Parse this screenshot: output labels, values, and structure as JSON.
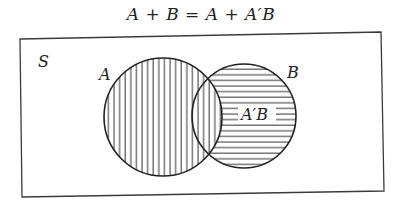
{
  "title": "A + B = A + A′B",
  "diagram": {
    "universe_label": "S",
    "set_a_label": "A",
    "set_b_label": "B",
    "region_label": "A′B",
    "colors": {
      "stroke": "#2a2a2a",
      "background": "#ffffff"
    },
    "shading": {
      "A": "vertical-lines",
      "A'B": "horizontal-lines"
    }
  }
}
